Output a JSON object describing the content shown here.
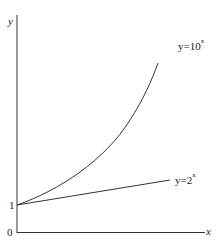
{
  "diagram": {
    "axes": {
      "x_label": "x",
      "y_label": "y",
      "origin_label": "0",
      "y_intercept_label": "1"
    },
    "curves": [
      {
        "name": "exp10",
        "label_base": "y=10",
        "label_exp": "x"
      },
      {
        "name": "exp2",
        "label_base": "y=2",
        "label_exp": "x"
      }
    ],
    "colors": {
      "line": "#222222",
      "background": "#ffffff"
    }
  }
}
